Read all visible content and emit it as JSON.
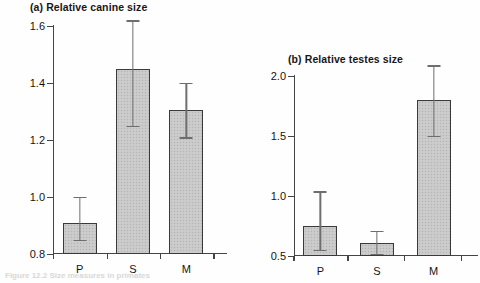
{
  "figure": {
    "caption": "Figure 12.2  Size measures in primates"
  },
  "chart_data": [
    {
      "type": "bar",
      "panel_label": "(a)",
      "title": "(a) Relative canine size",
      "xlabel": "",
      "ylabel": "",
      "categories": [
        "P",
        "S",
        "M"
      ],
      "values": [
        0.91,
        1.45,
        1.305
      ],
      "error_low": [
        0.85,
        1.25,
        1.21
      ],
      "error_high": [
        1.0,
        1.62,
        1.4
      ],
      "ylim": [
        0.8,
        1.6
      ],
      "yticks": [
        0.8,
        1.0,
        1.2,
        1.4,
        1.6
      ],
      "ytick_labels": [
        "0.8",
        "1.0",
        "1.2",
        "1.4",
        "1.6"
      ],
      "grid": false,
      "legend": "none",
      "bar_fill": "#c9c9c9",
      "bar_edge": "#3a3a3a",
      "error_color": "#6e6e6e"
    },
    {
      "type": "bar",
      "panel_label": "(b)",
      "title": "(b) Relative testes size",
      "xlabel": "",
      "ylabel": "",
      "categories": [
        "P",
        "S",
        "M"
      ],
      "values": [
        0.75,
        0.61,
        1.8
      ],
      "error_low": [
        0.55,
        0.52,
        1.5
      ],
      "error_high": [
        1.04,
        0.71,
        2.09
      ],
      "ylim": [
        0.5,
        2.0
      ],
      "yticks": [
        0.5,
        1.0,
        1.5,
        2.0
      ],
      "ytick_labels": [
        "0.5",
        "1.0",
        "1.5",
        "2.0"
      ],
      "grid": false,
      "legend": "none",
      "bar_fill": "#c9c9c9",
      "bar_edge": "#3a3a3a",
      "error_color": "#6e6e6e"
    }
  ]
}
